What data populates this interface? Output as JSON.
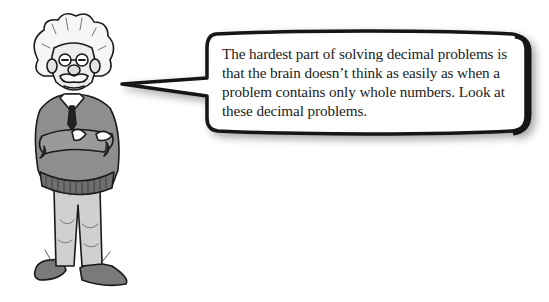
{
  "illustration": {
    "character": "cartoon professor with wild white hair, glasses, mustache, sweater and tie, arms crossed",
    "icon": "professor-character"
  },
  "speech_bubble": {
    "text": "The hardest part of solving decimal problems is that the brain doesn’t think as easily as when a problem contains only whole numbers. Look at these decimal problems."
  },
  "colors": {
    "outline": "#1a1a1a",
    "sweater": "#8c8c8c",
    "pants": "#c9c9c9",
    "hair": "#f4f4f4",
    "background": "#ffffff"
  }
}
